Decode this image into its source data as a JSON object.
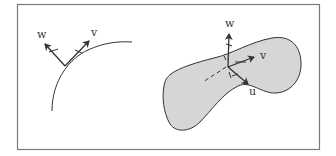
{
  "figure": {
    "frame_color": "#7a7a7a",
    "stroke_color": "#333333",
    "surface_fill": "#d6d6d6",
    "left_panel": {
      "description": "curve with tangent vector v and normal vector w",
      "labels": {
        "w": "w",
        "v": "v"
      }
    },
    "right_panel": {
      "description": "surface patch with orthonormal frame u, v, w",
      "labels": {
        "w": "w",
        "v": "v",
        "u": "u"
      }
    }
  }
}
